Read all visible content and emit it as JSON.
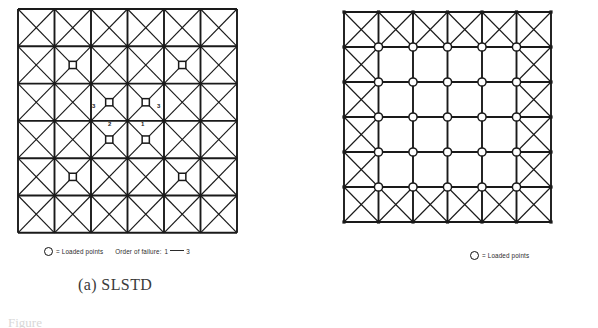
{
  "figure": {
    "fig_ref": "Figure",
    "panels": [
      {
        "id": "a",
        "caption": "(a)  SLSTD",
        "legend": {
          "marker_icon": "circle-marker-icon",
          "loaded_points_text": "= Loaded points",
          "order_prefix": "Order of failure:",
          "order_start": "1",
          "order_end": "3"
        },
        "grid": {
          "rows": 6,
          "cols": 6,
          "diagonals": "all-cells",
          "line_color": "#1a1a1a"
        },
        "loaded_points": [
          {
            "row": 2,
            "col": 2
          },
          {
            "row": 2,
            "col": 5
          },
          {
            "row": 3,
            "col": 3
          },
          {
            "row": 3,
            "col": 4
          },
          {
            "row": 4,
            "col": 3
          },
          {
            "row": 4,
            "col": 4
          },
          {
            "row": 5,
            "col": 2
          },
          {
            "row": 5,
            "col": 5
          }
        ],
        "order_labels": [
          {
            "text": "3",
            "x": 92,
            "y": 103
          },
          {
            "text": "3",
            "x": 157,
            "y": 103
          },
          {
            "text": "2",
            "x": 108,
            "y": 121
          },
          {
            "text": "1",
            "x": 141,
            "y": 121
          }
        ]
      },
      {
        "id": "b",
        "caption": "(b)  SLD",
        "legend": {
          "marker_icon": "circle-marker-icon",
          "loaded_points_text": "= Loaded points"
        },
        "grid": {
          "rows": 6,
          "cols": 6,
          "diagonals": "perimeter-cells-only",
          "line_color": "#1a1a1a"
        },
        "loaded_node_rows": 5,
        "loaded_node_cols": 5
      }
    ]
  },
  "colors": {
    "ink": "#1a1a1a",
    "text": "#3a3a3a",
    "legend_text": "#2b2b2b",
    "paper": "#ffffff"
  }
}
